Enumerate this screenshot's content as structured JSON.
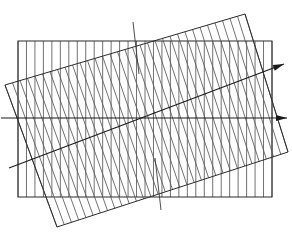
{
  "figure": {
    "background_color": "#ffffff",
    "width": 292,
    "height": 242,
    "colors": {
      "grating_a": "#4d4d4d",
      "grating_b": "#595959",
      "frame": "#2b2b2b",
      "axis": "#1a1a1a",
      "tick": "#3a3a3a"
    }
  },
  "chart_data": {
    "type": "diagram",
    "xlabel": "",
    "ylabel": "",
    "grid": false,
    "legend": "none",
    "xlim": [
      0,
      292
    ],
    "ylim": [
      0,
      242
    ],
    "gratings": [
      {
        "name": "upright-grating",
        "rotation_deg": 0,
        "line_orientation": "vertical",
        "line_count": 31,
        "line_spacing_px": 8.2,
        "rect": {
          "x": 18,
          "y": 41,
          "width": 254,
          "height": 156
        },
        "corners": [
          [
            18,
            41
          ],
          [
            272,
            41
          ],
          [
            272,
            197
          ],
          [
            18,
            197
          ]
        ],
        "color": "#4d4d4d"
      },
      {
        "name": "rotated-grating",
        "rotation_deg": -16.5,
        "line_orientation": "perpendicular-to-long-edge",
        "line_count": 33,
        "line_spacing_px": 8.6,
        "corners": [
          [
            5,
            85
          ],
          [
            245,
            14
          ],
          [
            288,
            152
          ],
          [
            57,
            227
          ]
        ],
        "color": "#595959"
      }
    ],
    "axes": [
      {
        "name": "horizontal-axis-arrow",
        "from": [
          1,
          118
        ],
        "to": [
          287,
          118
        ],
        "angle_deg": 0,
        "arrow": "end"
      },
      {
        "name": "oblique-axis-arrow",
        "from": [
          9,
          168
        ],
        "to": [
          284,
          64
        ],
        "angle_deg": -20.7,
        "arrow": "end"
      },
      {
        "name": "vertical-tick-upper",
        "from": [
          133,
          22
        ],
        "to": [
          139,
          74
        ],
        "angle_deg": 83.4,
        "arrow": "none"
      },
      {
        "name": "vertical-tick-lower",
        "from": [
          155,
          158
        ],
        "to": [
          161,
          210
        ],
        "angle_deg": 83.4,
        "arrow": "none"
      }
    ],
    "annotations": []
  }
}
